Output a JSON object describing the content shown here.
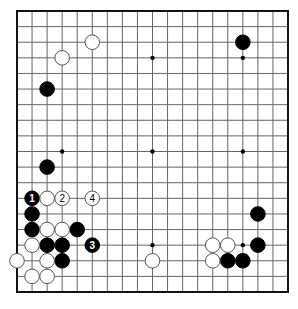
{
  "diagram": {
    "type": "go-board",
    "size": 19,
    "colors": {
      "black": "#000000",
      "white": "#ffffff",
      "line": "#666666",
      "edge": "#111111"
    },
    "star_points": [
      [
        3,
        3
      ],
      [
        9,
        3
      ],
      [
        15,
        3
      ],
      [
        3,
        9
      ],
      [
        9,
        9
      ],
      [
        15,
        9
      ],
      [
        3,
        15
      ],
      [
        9,
        15
      ],
      [
        15,
        15
      ]
    ],
    "stones": [
      {
        "color": "black",
        "col": 15,
        "row": 2,
        "label": ""
      },
      {
        "color": "black",
        "col": 2,
        "row": 5,
        "label": ""
      },
      {
        "color": "black",
        "col": 2,
        "row": 10,
        "label": ""
      },
      {
        "color": "black",
        "col": 1,
        "row": 12,
        "label": "1"
      },
      {
        "color": "black",
        "col": 1,
        "row": 13,
        "label": ""
      },
      {
        "color": "black",
        "col": 1,
        "row": 14,
        "label": ""
      },
      {
        "color": "black",
        "col": 4,
        "row": 14,
        "label": ""
      },
      {
        "color": "black",
        "col": 2,
        "row": 15,
        "label": ""
      },
      {
        "color": "black",
        "col": 3,
        "row": 15,
        "label": ""
      },
      {
        "color": "black",
        "col": 5,
        "row": 15,
        "label": "3"
      },
      {
        "color": "black",
        "col": 3,
        "row": 16,
        "label": ""
      },
      {
        "color": "black",
        "col": 16,
        "row": 13,
        "label": ""
      },
      {
        "color": "black",
        "col": 16,
        "row": 15,
        "label": ""
      },
      {
        "color": "black",
        "col": 14,
        "row": 16,
        "label": ""
      },
      {
        "color": "black",
        "col": 15,
        "row": 16,
        "label": ""
      },
      {
        "color": "white",
        "col": 5,
        "row": 2,
        "label": ""
      },
      {
        "color": "white",
        "col": 3,
        "row": 3,
        "label": ""
      },
      {
        "color": "white",
        "col": 2,
        "row": 12,
        "label": ""
      },
      {
        "color": "white",
        "col": 3,
        "row": 12,
        "label": "2"
      },
      {
        "color": "white",
        "col": 5,
        "row": 12,
        "label": "4"
      },
      {
        "color": "white",
        "col": 2,
        "row": 14,
        "label": ""
      },
      {
        "color": "white",
        "col": 3,
        "row": 14,
        "label": ""
      },
      {
        "color": "white",
        "col": 1,
        "row": 15,
        "label": ""
      },
      {
        "color": "white",
        "col": 0,
        "row": 16,
        "label": ""
      },
      {
        "color": "white",
        "col": 2,
        "row": 16,
        "label": ""
      },
      {
        "color": "white",
        "col": 1,
        "row": 17,
        "label": ""
      },
      {
        "color": "white",
        "col": 2,
        "row": 17,
        "label": ""
      },
      {
        "color": "white",
        "col": 13,
        "row": 15,
        "label": ""
      },
      {
        "color": "white",
        "col": 14,
        "row": 15,
        "label": ""
      },
      {
        "color": "white",
        "col": 13,
        "row": 16,
        "label": ""
      },
      {
        "color": "white",
        "col": 9,
        "row": 16,
        "label": ""
      }
    ]
  }
}
